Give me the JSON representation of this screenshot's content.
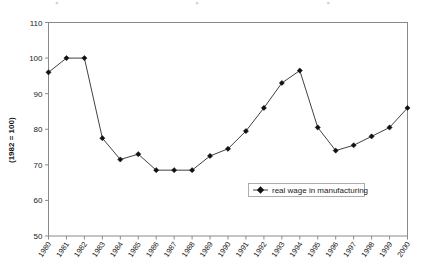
{
  "chart_data": {
    "type": "line",
    "title": "",
    "xlabel": "",
    "ylabel": "(1982 = 100)",
    "ylim": [
      50,
      110
    ],
    "ytick_step": 10,
    "yticks": [
      "50",
      "60",
      "70",
      "80",
      "90",
      "100",
      "110"
    ],
    "grid": false,
    "legend_position": "inside-lower-right",
    "categories": [
      "1980",
      "1981",
      "1982",
      "1983",
      "1984",
      "1985",
      "1986",
      "1987",
      "1988",
      "1989",
      "1990",
      "1991",
      "1992",
      "1993",
      "1994",
      "1995",
      "1996",
      "1997",
      "1998",
      "1999",
      "2000"
    ],
    "series": [
      {
        "name": "real wage in manufacturing",
        "marker": "diamond",
        "color": "#111111",
        "values": [
          96,
          100,
          100,
          77.5,
          71.5,
          73,
          68.5,
          68.5,
          68.5,
          72.5,
          74.5,
          79.5,
          86,
          93,
          96.5,
          80.5,
          74,
          75.5,
          78,
          80.5,
          86
        ]
      }
    ]
  },
  "legend": {
    "entries": [
      {
        "label": "real wage in manufacturing"
      }
    ]
  },
  "axes": {
    "y_axis_title": "(1982 = 100)"
  }
}
